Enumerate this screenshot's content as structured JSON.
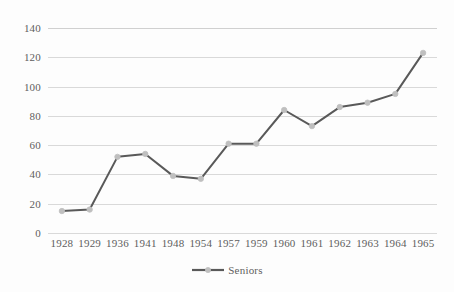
{
  "chart_data": {
    "type": "line",
    "title": "",
    "xlabel": "",
    "ylabel": "",
    "categories": [
      "1928",
      "1929",
      "1936",
      "1941",
      "1948",
      "1954",
      "1957",
      "1959",
      "1960",
      "1961",
      "1962",
      "1963",
      "1964",
      "1965"
    ],
    "series": [
      {
        "name": "Seniors",
        "values": [
          15,
          16,
          52,
          54,
          39,
          37,
          61,
          61,
          84,
          73,
          86,
          89,
          95,
          123
        ],
        "line_color": "#595959",
        "marker_color": "#bfbfbf",
        "marker_shape": "circle"
      }
    ],
    "ylim": [
      0,
      140
    ],
    "ytick_labels": [
      "0",
      "20",
      "40",
      "60",
      "80",
      "100",
      "120",
      "140"
    ],
    "ytick_values": [
      0,
      20,
      40,
      60,
      80,
      100,
      120,
      140
    ],
    "grid": true,
    "grid_axis": "y",
    "grid_color": "#d9d9d9",
    "legend_position": "bottom",
    "legend_entries": [
      "Seniors"
    ],
    "background_color": "#ffffff"
  }
}
